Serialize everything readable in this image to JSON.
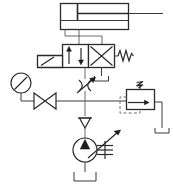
{
  "diagram": {
    "title": "Hydraulic Circuit Schematic",
    "type": "hydraulic-power-circuit",
    "background_color": "#ffffff",
    "line_color": "#3a3a3a",
    "symbol_color": "#2b2b2b",
    "pilot_line_color": "#6e6e6e"
  },
  "components": {
    "cylinder": {
      "name": "double-acting-cylinder",
      "label": "",
      "body": {
        "x": 60,
        "y": 3,
        "width": 68,
        "height": 26
      },
      "piston_x": 77,
      "rod_y": 13,
      "rod_end_x": 163,
      "port_cap_y": 36
    },
    "directional_valve": {
      "name": "directional-control-valve-4-2",
      "label": "",
      "positions": 2,
      "actuator_left": "manual-lever",
      "actuator_right": "return-spring",
      "box_a": {
        "x": 62,
        "y": 44,
        "width": 26,
        "height": 23
      },
      "box_b": {
        "x": 88,
        "y": 44,
        "width": 26,
        "height": 23
      },
      "lever": {
        "x": 37,
        "y": 55,
        "width": 25,
        "height": 12
      }
    },
    "pressure_gauge": {
      "name": "pressure-gauge",
      "label": "",
      "cx": 21,
      "cy": 83,
      "r": 10,
      "needle_angle_deg": 45
    },
    "shutoff_valve": {
      "name": "shutoff-valve",
      "label": "",
      "cx": 45,
      "cy": 101,
      "half_width": 11,
      "half_height": 8
    },
    "throttle_valve": {
      "name": "adjustable-throttle-valve",
      "label": "",
      "cx": 85,
      "cy": 88,
      "adjustable": true
    },
    "relief_valve": {
      "name": "pressure-relief-valve",
      "label": "",
      "box": {
        "x": 126,
        "y": 89,
        "width": 28,
        "height": 20
      },
      "spring_top": true,
      "pilot_dashed": true
    },
    "check_valve": {
      "name": "check-valve",
      "label": "",
      "cx": 85,
      "cy": 123,
      "size": 7
    },
    "pump": {
      "name": "variable-displacement-pump",
      "label": "",
      "cx": 85,
      "cy": 150,
      "r": 12,
      "drive": "prime-mover-shaft"
    },
    "reservoir": {
      "name": "reservoir-tank",
      "label": "",
      "cx": 85,
      "top_y": 172,
      "half_width": 11,
      "height": 9
    }
  },
  "connections": [
    {
      "name": "cylinder-cap-port-to-valve",
      "from": "cylinder",
      "to": "directional_valve"
    },
    {
      "name": "cylinder-rod-port-to-valve",
      "from": "cylinder",
      "to": "directional_valve"
    },
    {
      "name": "valve-tank-drain",
      "from": "directional_valve",
      "to": "reservoir"
    },
    {
      "name": "pressure-line-to-valve",
      "from": "throttle_valve",
      "to": "directional_valve"
    },
    {
      "name": "gauge-tap",
      "from": "pressure_gauge",
      "to": "pressure-line"
    },
    {
      "name": "shutoff-to-throttle",
      "from": "shutoff_valve",
      "to": "throttle_valve"
    },
    {
      "name": "throttle-to-relief",
      "from": "throttle_valve",
      "to": "relief_valve"
    },
    {
      "name": "relief-to-tank",
      "from": "relief_valve",
      "to": "reservoir"
    },
    {
      "name": "pump-to-check-valve",
      "from": "pump",
      "to": "check_valve"
    },
    {
      "name": "check-valve-to-pressure-line",
      "from": "check_valve",
      "to": "pressure-line"
    },
    {
      "name": "pump-suction-from-tank",
      "from": "reservoir",
      "to": "pump"
    }
  ]
}
